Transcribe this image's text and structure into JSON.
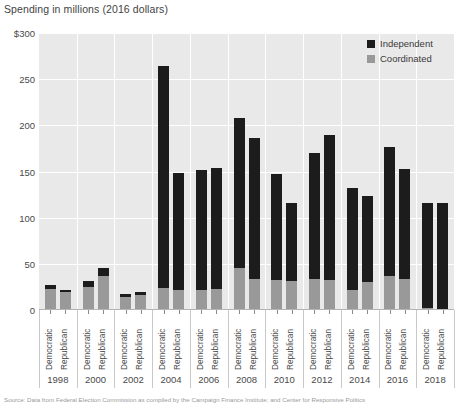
{
  "chart_data": {
    "type": "bar",
    "title": "Spending in millions (2016 dollars)",
    "xlabel": "",
    "ylabel": "Spending in millions (2016 dollars)",
    "ylim": [
      0,
      300
    ],
    "yticks": [
      "$300",
      "250",
      "200",
      "150",
      "100",
      "50",
      "0"
    ],
    "ytick_values": [
      300,
      250,
      200,
      150,
      100,
      50,
      0
    ],
    "grid": true,
    "stacked": true,
    "legend_position": "top-right",
    "legend": [
      "Independent",
      "Coordinated"
    ],
    "categories": [
      "1998 Democratic",
      "1998 Republican",
      "2000 Democratic",
      "2000 Republican",
      "2002 Democratic",
      "2002 Republican",
      "2004 Democratic",
      "2004 Republican",
      "2006 Democratic",
      "2006 Republican",
      "2008 Democratic",
      "2008 Republican",
      "2010 Democratic",
      "2010 Republican",
      "2012 Democratic",
      "2012 Republican",
      "2014 Democratic",
      "2014 Republican",
      "2016 Democratic",
      "2016 Republican",
      "2018 Democratic",
      "2018 Republican"
    ],
    "years": [
      "1998",
      "2000",
      "2002",
      "2004",
      "2006",
      "2008",
      "2010",
      "2012",
      "2014",
      "2016",
      "2018"
    ],
    "parties": [
      "Democratic",
      "Republican"
    ],
    "series": [
      {
        "name": "Independent",
        "color": "#1c1c1c",
        "values": [
          4,
          3,
          6,
          8,
          3,
          4,
          240,
          126,
          130,
          131,
          163,
          152,
          114,
          85,
          136,
          157,
          110,
          94,
          140,
          119,
          114,
          115
        ]
      },
      {
        "name": "Coordinated",
        "color": "#999999",
        "values": [
          23,
          19,
          25,
          37,
          14,
          16,
          24,
          22,
          22,
          23,
          45,
          34,
          33,
          31,
          34,
          33,
          22,
          30,
          37,
          34,
          2,
          1
        ]
      }
    ],
    "totals": [
      27,
      22,
      31,
      45,
      17,
      20,
      264,
      148,
      152,
      154,
      208,
      186,
      147,
      116,
      170,
      190,
      132,
      124,
      177,
      153,
      116,
      116
    ]
  },
  "footnote": "Source: Data from Federal Election Commission as compiled by the Campaign Finance Institute; and Center for Responsive Politics"
}
